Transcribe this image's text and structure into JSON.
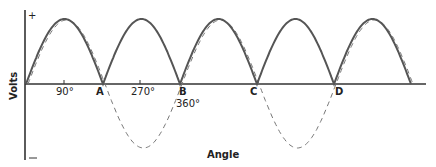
{
  "diagram": {
    "type": "full-wave rectified sine wave",
    "y_axis": {
      "label": "Volts",
      "top_sign": "+",
      "bottom_sign": "—"
    },
    "x_axis": {
      "label": "Angle"
    },
    "tick_labels": {
      "t90": "90°",
      "t270": "270°",
      "t360": "360°"
    },
    "point_labels": {
      "A": "A",
      "B": "B",
      "C": "C",
      "D": "D"
    },
    "series": [
      {
        "name": "rectified output",
        "style": "solid",
        "color": "#555555"
      },
      {
        "name": "original AC input",
        "style": "dashed",
        "color": "#777777"
      }
    ]
  },
  "chart_data": {
    "type": "line",
    "title": "",
    "xlabel": "Angle",
    "ylabel": "Volts",
    "x_ticks": [
      "90°",
      "A",
      "270°",
      "B 360°",
      "C",
      "D"
    ],
    "series": [
      {
        "name": "Full-wave rectified (solid)",
        "x_deg": [
          0,
          90,
          180,
          270,
          360,
          450,
          540,
          630,
          720,
          810,
          900
        ],
        "y": [
          0,
          1,
          0,
          1,
          0,
          1,
          0,
          1,
          0,
          1,
          0
        ]
      },
      {
        "name": "AC sine (dashed)",
        "x_deg": [
          0,
          90,
          180,
          270,
          360,
          450,
          540,
          630,
          720,
          810,
          900
        ],
        "y": [
          0,
          1,
          0,
          -1,
          0,
          1,
          0,
          -1,
          0,
          1,
          0
        ]
      }
    ],
    "ylim": [
      -1,
      1
    ],
    "grid": false
  }
}
